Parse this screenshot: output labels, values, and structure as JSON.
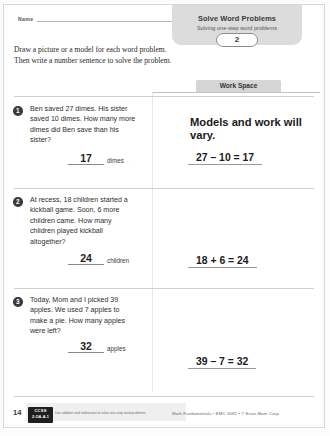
{
  "header": {
    "name_label": "Name",
    "badge_title": "Solve Word Problems",
    "badge_subtitle": "Solving one-step word problems",
    "badge_number": "2"
  },
  "instructions": {
    "line1": "Draw a picture or a model for each word problem.",
    "line2": "Then write a number sentence to solve the problem."
  },
  "workspace": {
    "tab_label": "Work Space",
    "note": "Models and work will vary."
  },
  "problems": [
    {
      "number": "1",
      "text": "Ben saved 27 dimes. His sister saved 10 dimes. How many more dimes did Ben save than his sister?",
      "answer": "17",
      "unit": "dimes",
      "trailing_mark": "·",
      "work": "27 – 10 = 17"
    },
    {
      "number": "2",
      "text": "At recess, 18 children started a kickball game. Soon, 6 more children came. How many children played kickball altogether?",
      "answer": "24",
      "unit": "children",
      "trailing_mark": "",
      "work": "18 + 6 = 24"
    },
    {
      "number": "3",
      "text": "Today, Mom and I picked 39 apples. We used 7 apples to make a pie. How many apples were left?",
      "answer": "32",
      "unit": "apples",
      "trailing_mark": "",
      "work": "39 – 7 = 32"
    }
  ],
  "footer": {
    "page_number": "14",
    "ccss_name": "CCSS",
    "ccss_code": "2.OA.A.1",
    "ccss_description": "Use addition and subtraction to solve one-step word problems.",
    "credit": "Math Fundamentals • EMC 3082 • © Evan-Moor Corp."
  }
}
